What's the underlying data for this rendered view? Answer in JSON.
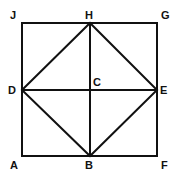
{
  "diagram": {
    "points": {
      "J": {
        "label": "J",
        "x": 22,
        "y": 23
      },
      "H": {
        "label": "H",
        "x": 90,
        "y": 23
      },
      "G": {
        "label": "G",
        "x": 157,
        "y": 23
      },
      "D": {
        "label": "D",
        "x": 22,
        "y": 90
      },
      "C": {
        "label": "C",
        "x": 90,
        "y": 90
      },
      "E": {
        "label": "E",
        "x": 157,
        "y": 90
      },
      "A": {
        "label": "A",
        "x": 22,
        "y": 156
      },
      "B": {
        "label": "B",
        "x": 90,
        "y": 156
      },
      "F": {
        "label": "F",
        "x": 157,
        "y": 156
      }
    },
    "segments": [
      "JG",
      "GF",
      "FA",
      "AJ",
      "HB",
      "DE",
      "DH",
      "HE",
      "EB",
      "BD"
    ],
    "stroke_color": "#111111"
  }
}
